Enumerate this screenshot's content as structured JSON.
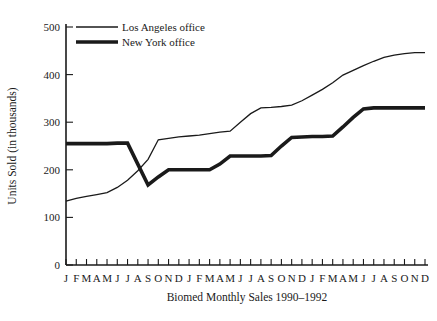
{
  "chart_data": {
    "type": "line",
    "title": "",
    "xlabel": "Biomed Monthly Sales 1990–1992",
    "ylabel": "Units Sold (in thousands)",
    "ylim": [
      0,
      500
    ],
    "yticks": [
      0,
      100,
      200,
      300,
      400,
      500
    ],
    "ytick_labels": [
      "0",
      "100",
      "200",
      "300",
      "400",
      "500"
    ],
    "grid": false,
    "legend_position": "top-left",
    "categories": [
      "J",
      "F",
      "M",
      "A",
      "M",
      "J",
      "J",
      "A",
      "S",
      "O",
      "N",
      "D",
      "J",
      "F",
      "M",
      "A",
      "M",
      "J",
      "J",
      "A",
      "S",
      "O",
      "N",
      "D",
      "J",
      "F",
      "M",
      "A",
      "M",
      "J",
      "J",
      "A",
      "S",
      "O",
      "N",
      "D"
    ],
    "series": [
      {
        "name": "Los Angeles office",
        "style": "thin",
        "values": [
          134,
          140,
          144,
          148,
          152,
          163,
          178,
          198,
          222,
          263,
          266,
          269,
          271,
          273,
          276,
          279,
          281,
          300,
          318,
          330,
          331,
          333,
          336,
          345,
          357,
          369,
          383,
          399,
          409,
          419,
          428,
          436,
          441,
          444,
          446,
          446
        ]
      },
      {
        "name": "New York office",
        "style": "thick",
        "values": [
          255,
          255,
          255,
          255,
          255,
          256,
          256,
          212,
          168,
          185,
          200,
          200,
          200,
          200,
          200,
          212,
          229,
          229,
          229,
          229,
          230,
          250,
          268,
          269,
          270,
          270,
          271,
          290,
          310,
          328,
          330,
          330,
          330,
          330,
          330,
          330
        ]
      }
    ]
  },
  "legend": {
    "items": [
      {
        "label": "Los Angeles office",
        "style": "thin"
      },
      {
        "label": "New York office",
        "style": "thick"
      }
    ]
  }
}
